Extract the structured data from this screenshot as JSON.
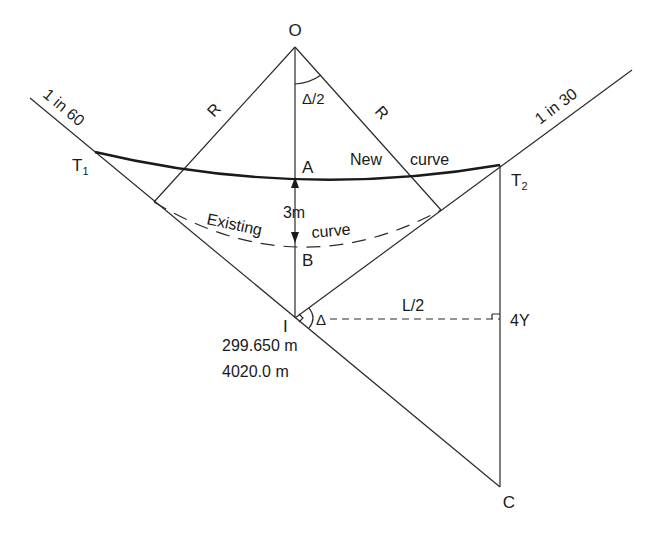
{
  "diagram": {
    "colors": {
      "stroke": "#2a2a2a",
      "text": "#1a1a1a",
      "background": "#ffffff"
    },
    "points": {
      "O": {
        "label": "O"
      },
      "A": {
        "label": "A"
      },
      "B": {
        "label": "B"
      },
      "I": {
        "label": "I"
      },
      "T1": {
        "label": "T",
        "sub": "1"
      },
      "T2": {
        "label": "T",
        "sub": "2"
      },
      "C": {
        "label": "C"
      },
      "Y": {
        "label": "4Y"
      }
    },
    "labels": {
      "grade_left": "1 in 60",
      "grade_right": "1 in 30",
      "radius_left": "R",
      "radius_right": "R",
      "half_angle": "Δ/2",
      "deflection_angle": "Δ",
      "offset": "3m",
      "half_length": "L/2",
      "new_curve_word1": "New",
      "new_curve_word2": "curve",
      "existing_curve_word1": "Existing",
      "existing_curve_word2": "curve",
      "level_I": "299.650 m",
      "chainage_I": "4020.0 m"
    }
  }
}
